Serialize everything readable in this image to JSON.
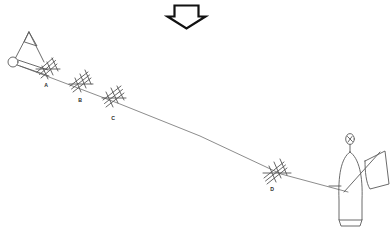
{
  "diagram": {
    "background_color": "#ffffff",
    "line_color": "#6e6e6e",
    "marker_color": "#555555",
    "figure_color": "#5a5a5a",
    "arrow_color": "#111111"
  },
  "arrow": {
    "name": "down-arrow",
    "direction": "down",
    "fill": "#ffffff",
    "outline": "#111111"
  },
  "main_line": {
    "name": "main-diagonal-line",
    "start": {
      "x": 20,
      "y": 66
    },
    "end": {
      "x": 348,
      "y": 192
    }
  },
  "markers": [
    {
      "id": "A",
      "label": "A",
      "x": 47,
      "y": 74,
      "label_x": 46,
      "label_y": 86,
      "rungs": 3
    },
    {
      "id": "B",
      "label": "B",
      "x": 81,
      "y": 88,
      "label_x": 80,
      "label_y": 101,
      "rungs": 3
    },
    {
      "id": "C",
      "label": "C",
      "x": 114,
      "y": 101,
      "label_x": 113,
      "label_y": 119,
      "rungs": 3
    },
    {
      "id": "D",
      "label": "D",
      "x": 281,
      "y": 174,
      "label_x": 272,
      "label_y": 190,
      "rungs": 3
    }
  ],
  "left_figure": {
    "name": "observer-with-triangle",
    "circle": {
      "x": 13,
      "y": 62,
      "r": 5
    },
    "triangle_peak": {
      "x": 29,
      "y": 32
    },
    "description": "small circle with triangular sail shape and radiating lines"
  },
  "right_figure": {
    "name": "person-with-flag",
    "head": {
      "x": 350,
      "y": 139,
      "rx": 4.5,
      "ry": 5.5
    },
    "body_top": {
      "x": 350,
      "y": 152
    },
    "body_bottom": {
      "x": 350,
      "y": 222
    },
    "flag_pole_start": {
      "x": 345,
      "y": 190
    },
    "flag_pole_end": {
      "x": 380,
      "y": 152
    },
    "description": "upright elongated body with oval head and waving flag"
  },
  "labels": {
    "a": "A",
    "b": "B",
    "c": "C",
    "d": "D"
  }
}
